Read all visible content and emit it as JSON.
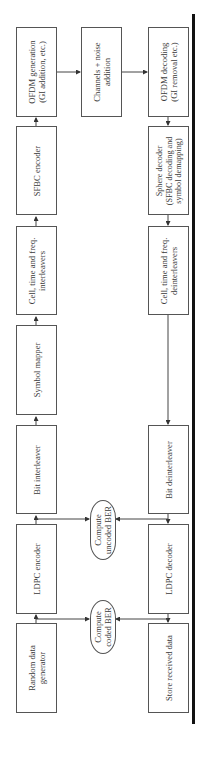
{
  "figure": {
    "type": "block-diagram",
    "orientation": "rotated-90",
    "transmitter": [
      {
        "id": "random_data_generator",
        "label": "Random data\ngenerator"
      },
      {
        "id": "ldpc_encoder",
        "label": "LDPC encoder"
      },
      {
        "id": "bit_interleaver",
        "label": "Bit interleaver"
      },
      {
        "id": "symbol_mapper",
        "label": "Symbol mapper"
      },
      {
        "id": "cell_interleavers",
        "label": "Cell, time and freq.\ninterleavers"
      },
      {
        "id": "sfbc_encoder",
        "label": "SFBC encoder"
      },
      {
        "id": "ofdm_generation",
        "label": "OFDM generation\n(GI addition, etc.)"
      }
    ],
    "channel": {
      "id": "channel",
      "label": "Channels + noise\naddition"
    },
    "receiver": [
      {
        "id": "ofdm_decoding",
        "label": "OFDM decoding\n(GI removal etc.)"
      },
      {
        "id": "sphere_decoder",
        "label": "Sphere decoder\n(SFBC decoding and\nsymbol demapping)"
      },
      {
        "id": "cell_deinterleavers",
        "label": "Cell, time and freq.\ndeinterleavers"
      },
      {
        "id": "bit_deinterleaver",
        "label": "Bit deinterleaver"
      },
      {
        "id": "ldpc_decoder",
        "label": "LDPC decoder"
      },
      {
        "id": "store_received_data",
        "label": "Store received data"
      }
    ],
    "metrics": [
      {
        "id": "uncoded_ber",
        "label": "Compute\nuncoded BER"
      },
      {
        "id": "coded_ber",
        "label": "Compute\ncoded BER"
      }
    ]
  }
}
